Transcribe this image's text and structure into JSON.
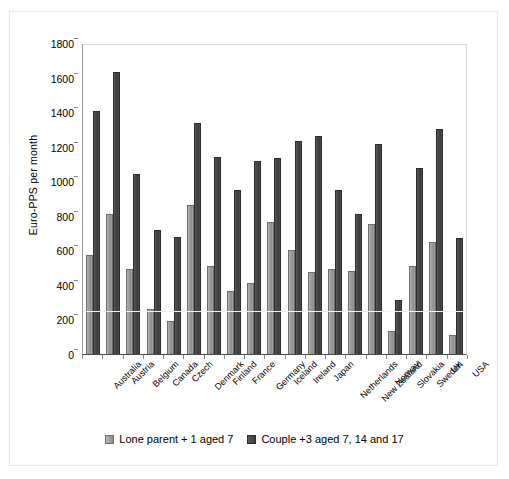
{
  "chart_data": {
    "type": "bar",
    "title": "",
    "subtitle": "",
    "xlabel": "",
    "ylabel": "Euro-PPS per month",
    "ylim": [
      0,
      1800
    ],
    "ytick_step": 200,
    "yticks": [
      "1800",
      "1600",
      "1400",
      "1200",
      "1000",
      "800",
      "600",
      "400",
      "200",
      "0"
    ],
    "grid": "faint horizontal gridline near 260",
    "legend_position": "bottom-center",
    "categories": [
      "Australia",
      "Austria",
      "Belgium",
      "Canada",
      "Czech",
      "Denmark",
      "Finland",
      "France",
      "Germany",
      "Iceland",
      "Ireland",
      "Japan",
      "Netherlands",
      "New Zealand",
      "Norway",
      "Slovakia",
      "Sweden",
      "UK",
      "USA"
    ],
    "series": [
      {
        "name": "Lone parent + 1 aged 7",
        "color": "#9d9d9d",
        "values": [
          575,
          810,
          490,
          258,
          190,
          860,
          512,
          365,
          410,
          765,
          600,
          475,
          490,
          480,
          755,
          135,
          512,
          648,
          110
        ]
      },
      {
        "name": "Couple +3 aged 7, 14 and 17",
        "color": "#454545",
        "values": [
          1405,
          1630,
          1040,
          720,
          675,
          1335,
          1140,
          950,
          1120,
          1135,
          1230,
          1260,
          950,
          810,
          1215,
          315,
          1075,
          1300,
          670
        ]
      }
    ]
  },
  "legend": {
    "items": [
      {
        "label": "Lone parent + 1 aged 7",
        "swatch": "series-1-swatch"
      },
      {
        "label": "Couple +3 aged 7, 14 and 17",
        "swatch": "series-2-swatch"
      }
    ]
  }
}
